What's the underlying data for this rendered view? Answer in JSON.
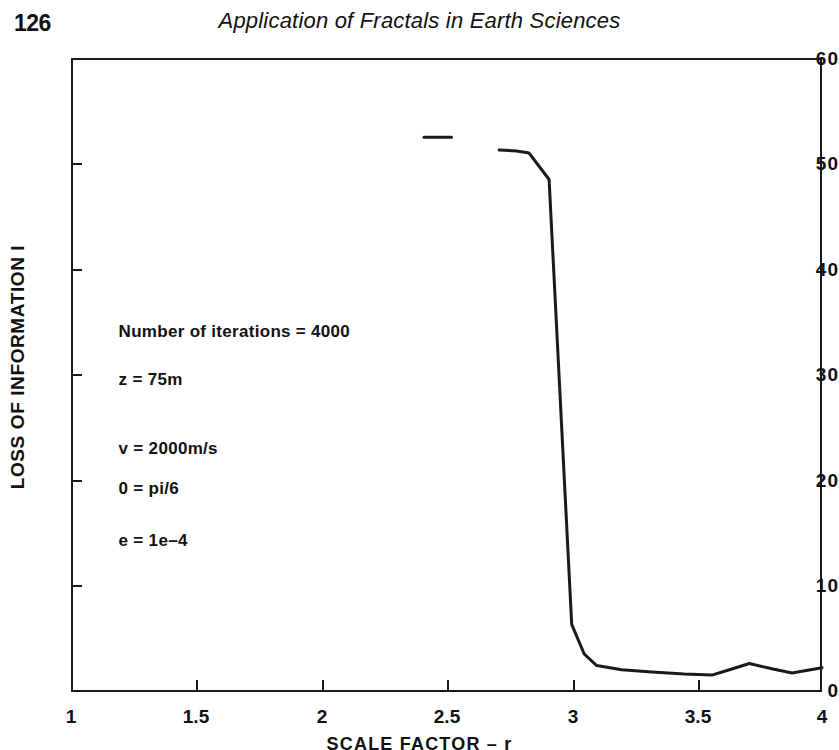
{
  "header": {
    "page_number": "126",
    "book_title": "Application of Fractals in Earth Sciences"
  },
  "chart_data": {
    "type": "line",
    "title": "",
    "xlabel": "SCALE FACTOR – r",
    "ylabel": "LOSS OF INFORMATION  I",
    "xlim": [
      1,
      4
    ],
    "ylim": [
      0,
      60
    ],
    "grid": false,
    "legend": "none",
    "xticks": [
      "1",
      "1.5",
      "2",
      "2.5",
      "3",
      "3.5",
      "4"
    ],
    "xtick_values": [
      1,
      1.5,
      2,
      2.5,
      3,
      3.5,
      4
    ],
    "yticks": [
      "0",
      "10",
      "20",
      "30",
      "40",
      "50",
      "60"
    ],
    "ytick_values": [
      0,
      10,
      20,
      30,
      40,
      50,
      60
    ],
    "series": [
      {
        "name": "leading-segment",
        "x": [
          2.41,
          2.52
        ],
        "values": [
          52.5,
          52.5
        ]
      },
      {
        "name": "loss-of-information",
        "x": [
          2.71,
          2.78,
          2.83,
          2.91,
          3.0,
          3.05,
          3.1,
          3.2,
          3.32,
          3.45,
          3.56,
          3.63,
          3.71,
          3.8,
          3.88,
          4.0
        ],
        "values": [
          51.3,
          51.2,
          51.0,
          48.5,
          6.4,
          3.6,
          2.5,
          2.1,
          1.9,
          1.7,
          1.6,
          2.1,
          2.7,
          2.2,
          1.8,
          2.3
        ]
      }
    ],
    "annotations": [
      {
        "text": "Number of iterations = 4000",
        "x": 1.19,
        "y": 34.0
      },
      {
        "text": "z = 75m",
        "x": 1.19,
        "y": 29.4
      },
      {
        "text": "v = 2000m/s",
        "x": 1.19,
        "y": 22.9
      },
      {
        "text": "0 = pi/6",
        "x": 1.19,
        "y": 19.1
      },
      {
        "text": "e = 1e–4",
        "x": 1.19,
        "y": 14.2
      }
    ],
    "line_color": "#1a1a1a"
  }
}
